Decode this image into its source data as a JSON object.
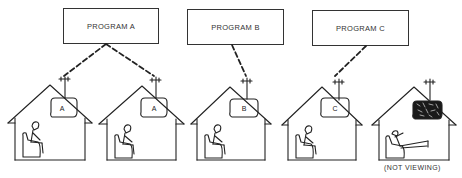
{
  "diagram": {
    "programs": [
      {
        "id": "A",
        "label": "PROGRAM A"
      },
      {
        "id": "B",
        "label": "PROGRAM B"
      },
      {
        "id": "C",
        "label": "PROGRAM C"
      }
    ],
    "houses": [
      {
        "index": 1,
        "tv_screen": "A",
        "program": "A",
        "viewing": true
      },
      {
        "index": 2,
        "tv_screen": "A",
        "program": "A",
        "viewing": true
      },
      {
        "index": 3,
        "tv_screen": "B",
        "program": "B",
        "viewing": true
      },
      {
        "index": 4,
        "tv_screen": "C",
        "program": "C",
        "viewing": true
      },
      {
        "index": 5,
        "tv_screen": "static",
        "program": null,
        "viewing": false,
        "caption": "(NOT VIEWING)"
      }
    ],
    "line_color": "#222222",
    "background": "#ffffff"
  }
}
